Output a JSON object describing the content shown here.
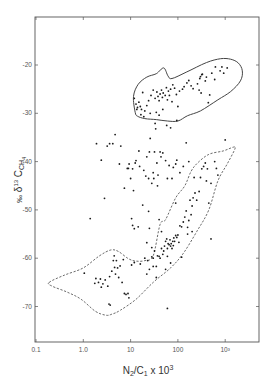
{
  "chart_data": {
    "type": "scatter",
    "title": "",
    "xlabel": "N2/C1 x 10^3",
    "ylabel": "‰ δ13C CH4",
    "xscale": "log",
    "xlim": [
      0.1,
      5000
    ],
    "ylim": [
      -77,
      -10
    ],
    "x_ticks": [
      {
        "value": 0.1,
        "label": "0.1"
      },
      {
        "value": 1,
        "label": "1.0"
      },
      {
        "value": 10,
        "label": "10"
      },
      {
        "value": 100,
        "label": "100"
      },
      {
        "value": 1000,
        "label": "10³"
      }
    ],
    "y_ticks": [
      {
        "value": -20,
        "label": "-20"
      },
      {
        "value": -30,
        "label": "-30"
      },
      {
        "value": -40,
        "label": "-40"
      },
      {
        "value": -50,
        "label": "-50"
      },
      {
        "value": -60,
        "label": "-60"
      },
      {
        "value": -70,
        "label": "-70"
      }
    ],
    "grid": false,
    "legend": null,
    "envelopes": [
      {
        "name": "upper group (solid)",
        "style": "solid",
        "points": [
          [
            12.5,
            -29.8
          ],
          [
            11.5,
            -26.5
          ],
          [
            14.5,
            -24
          ],
          [
            22,
            -22.5
          ],
          [
            35,
            -21.8
          ],
          [
            50,
            -20.6
          ],
          [
            62,
            -22.3
          ],
          [
            75,
            -22.8
          ],
          [
            150,
            -21.5
          ],
          [
            400,
            -19.5
          ],
          [
            800,
            -18.7
          ],
          [
            1300,
            -18.8
          ],
          [
            1900,
            -19.6
          ],
          [
            2300,
            -21.2
          ],
          [
            2100,
            -23.3
          ],
          [
            1300,
            -25.5
          ],
          [
            700,
            -27.2
          ],
          [
            300,
            -29.5
          ],
          [
            160,
            -30.5
          ],
          [
            100,
            -31.6
          ],
          [
            60,
            -31.6
          ],
          [
            35,
            -31.3
          ],
          [
            20,
            -31.1
          ],
          [
            14,
            -30.6
          ]
        ]
      },
      {
        "name": "lower group (dashed)",
        "style": "dashed",
        "points": [
          [
            0.19,
            -65
          ],
          [
            0.4,
            -63.5
          ],
          [
            1.0,
            -62
          ],
          [
            2.2,
            -59.5
          ],
          [
            3.8,
            -58.3
          ],
          [
            5.5,
            -58.6
          ],
          [
            9,
            -60.1
          ],
          [
            13,
            -60.6
          ],
          [
            20,
            -60.5
          ],
          [
            30,
            -59.5
          ],
          [
            42,
            -53
          ],
          [
            55,
            -52
          ],
          [
            90,
            -47.5
          ],
          [
            140,
            -45
          ],
          [
            190,
            -42
          ],
          [
            260,
            -40.3
          ],
          [
            450,
            -38.5
          ],
          [
            900,
            -37.8
          ],
          [
            1500,
            -37
          ],
          [
            1600,
            -37.4
          ],
          [
            1100,
            -40.5
          ],
          [
            700,
            -44
          ],
          [
            450,
            -50
          ],
          [
            250,
            -54.5
          ],
          [
            130,
            -59
          ],
          [
            70,
            -62
          ],
          [
            30,
            -65
          ],
          [
            13,
            -68.5
          ],
          [
            6,
            -70.8
          ],
          [
            4,
            -71.6
          ],
          [
            3,
            -71.8
          ],
          [
            1.8,
            -71
          ],
          [
            0.9,
            -68.5
          ],
          [
            0.45,
            -67
          ],
          [
            0.22,
            -65.8
          ]
        ]
      }
    ],
    "series": [
      {
        "name": "upper cluster",
        "points": [
          [
            12,
            -26.9
          ],
          [
            13,
            -28.1
          ],
          [
            14,
            -28.8
          ],
          [
            15,
            -27.7
          ],
          [
            16,
            -28.6
          ],
          [
            17,
            -29.2
          ],
          [
            13.5,
            -29.2
          ],
          [
            16.5,
            -30.3
          ],
          [
            19,
            -30.7
          ],
          [
            20,
            -29.5
          ],
          [
            22,
            -28.4
          ],
          [
            24,
            -27.4
          ],
          [
            27,
            -26.3
          ],
          [
            30,
            -25.2
          ],
          [
            33,
            -26.9
          ],
          [
            36,
            -25.6
          ],
          [
            38,
            -26.5
          ],
          [
            40,
            -27.4
          ],
          [
            42,
            -26
          ],
          [
            45,
            -25.2
          ],
          [
            47,
            -26.7
          ],
          [
            49,
            -25.8
          ],
          [
            54,
            -26.3
          ],
          [
            57,
            -24.7
          ],
          [
            60,
            -27.2
          ],
          [
            63,
            -25.4
          ],
          [
            66,
            -26.3
          ],
          [
            70,
            -25
          ],
          [
            78,
            -24.1
          ],
          [
            85,
            -24.8
          ],
          [
            93,
            -26.1
          ],
          [
            108,
            -25.4
          ],
          [
            125,
            -25
          ],
          [
            135,
            -24.5
          ],
          [
            155,
            -23.7
          ],
          [
            170,
            -23.2
          ],
          [
            190,
            -24.3
          ],
          [
            210,
            -24.9
          ],
          [
            260,
            -23.9
          ],
          [
            280,
            -25.2
          ],
          [
            290,
            -22.8
          ],
          [
            300,
            -22.4
          ],
          [
            310,
            -25.8
          ],
          [
            320,
            -22
          ],
          [
            330,
            -21.9
          ],
          [
            380,
            -23.3
          ],
          [
            400,
            -22.5
          ],
          [
            440,
            -27.8
          ],
          [
            470,
            -26.2
          ],
          [
            520,
            -21.7
          ],
          [
            600,
            -23
          ],
          [
            620,
            -20.4
          ],
          [
            780,
            -21.2
          ],
          [
            850,
            -20.4
          ],
          [
            930,
            -21.7
          ],
          [
            1100,
            -20.6
          ],
          [
            48,
            -29.2
          ],
          [
            58,
            -32.5
          ],
          [
            75,
            -27.6
          ],
          [
            95,
            -31.5
          ],
          [
            100,
            -28.6
          ],
          [
            35,
            -29.8
          ],
          [
            40,
            -30.4
          ],
          [
            26,
            -30
          ],
          [
            18,
            -25.7
          ]
        ]
      },
      {
        "name": "scattered middle",
        "points": [
          [
            1.9,
            -36.3
          ],
          [
            2.4,
            -39.7
          ],
          [
            2.8,
            -47.6
          ],
          [
            3.2,
            -36.8
          ],
          [
            3.6,
            -36.3
          ],
          [
            4.2,
            -36.3
          ],
          [
            4.7,
            -34.4
          ],
          [
            5.8,
            -40.5
          ],
          [
            6.2,
            -36.8
          ],
          [
            7.4,
            -45.5
          ],
          [
            8.5,
            -41.4
          ],
          [
            9,
            -41.4
          ],
          [
            9.3,
            -40.5
          ],
          [
            10,
            -43.5
          ],
          [
            11,
            -41.5
          ],
          [
            11.5,
            -46
          ],
          [
            12.5,
            -40.3
          ],
          [
            13,
            -39.8
          ],
          [
            14.5,
            -53.5
          ],
          [
            15,
            -37.8
          ],
          [
            15.5,
            -41
          ],
          [
            18,
            -49
          ],
          [
            19,
            -41.8
          ],
          [
            21,
            -43
          ],
          [
            22,
            -39
          ],
          [
            24,
            -43.5
          ],
          [
            25,
            -38
          ],
          [
            26,
            -35.2
          ],
          [
            28,
            -44.5
          ],
          [
            30,
            -42.3
          ],
          [
            31,
            -43.5
          ],
          [
            32,
            -38
          ],
          [
            33,
            -32.1
          ],
          [
            34,
            -33.2
          ],
          [
            36,
            -40.3
          ],
          [
            37,
            -45
          ],
          [
            38,
            -42.8
          ],
          [
            42,
            -38
          ],
          [
            44,
            -39
          ],
          [
            48,
            -38.2
          ],
          [
            55,
            -39.8
          ],
          [
            60,
            -43.5
          ],
          [
            65,
            -40.8
          ],
          [
            70,
            -33
          ],
          [
            75,
            -43.5
          ],
          [
            80,
            -41.2
          ],
          [
            90,
            -40.5
          ],
          [
            95,
            -39.7
          ],
          [
            110,
            -42.3
          ],
          [
            130,
            -41
          ],
          [
            150,
            -36.1
          ],
          [
            170,
            -40
          ],
          [
            220,
            -43.3
          ],
          [
            1.4,
            -51.8
          ],
          [
            10.5,
            -51.8
          ],
          [
            11,
            -53.2
          ],
          [
            12,
            -53.9
          ],
          [
            24,
            -50.3
          ]
        ]
      },
      {
        "name": "lower cluster",
        "points": [
          [
            1.05,
            -63.1
          ],
          [
            1.75,
            -65.2
          ],
          [
            1.85,
            -64.2
          ],
          [
            2.1,
            -65
          ],
          [
            2.3,
            -64.3
          ],
          [
            2.4,
            -66
          ],
          [
            2.6,
            -65.3
          ],
          [
            2.9,
            -64.5
          ],
          [
            3.3,
            -65.8
          ],
          [
            3.6,
            -63.8
          ],
          [
            4,
            -62.7
          ],
          [
            4.3,
            -60.5
          ],
          [
            4.6,
            -61.9
          ],
          [
            4.8,
            -63.3
          ],
          [
            5,
            -60.5
          ],
          [
            5.3,
            -62
          ],
          [
            5.6,
            -64
          ],
          [
            6,
            -61.6
          ],
          [
            6.6,
            -65
          ],
          [
            7,
            -60.3
          ],
          [
            7.4,
            -67.3
          ],
          [
            8,
            -67.5
          ],
          [
            8.8,
            -67.3
          ],
          [
            9.2,
            -68.2
          ],
          [
            10.5,
            -61.4
          ],
          [
            4.5,
            -59.5
          ],
          [
            3.5,
            -69.5
          ],
          [
            3.7,
            -69.7
          ],
          [
            12,
            -60.9
          ],
          [
            16,
            -61.2
          ],
          [
            20,
            -60
          ],
          [
            22,
            -63.3
          ],
          [
            23,
            -60.5
          ],
          [
            25,
            -62.3
          ],
          [
            28,
            -59.7
          ],
          [
            30,
            -60
          ],
          [
            32,
            -58.5
          ],
          [
            35,
            -61.7
          ],
          [
            37,
            -59.5
          ],
          [
            40,
            -59.6
          ],
          [
            42,
            -60
          ],
          [
            45,
            -58
          ],
          [
            48,
            -59.2
          ],
          [
            50,
            -58.5
          ],
          [
            52,
            -57.5
          ],
          [
            55,
            -56.5
          ],
          [
            58,
            -56
          ],
          [
            60,
            -58
          ],
          [
            62,
            -57
          ],
          [
            65,
            -57.2
          ],
          [
            68,
            -56.2
          ],
          [
            70,
            -57.5
          ],
          [
            72,
            -57
          ],
          [
            75,
            -58
          ],
          [
            78,
            -56.5
          ],
          [
            80,
            -57.4
          ],
          [
            82,
            -55.8
          ],
          [
            85,
            -56.5
          ],
          [
            90,
            -55.3
          ],
          [
            95,
            -55.7
          ],
          [
            100,
            -55.2
          ],
          [
            105,
            -56.7
          ],
          [
            110,
            -53.3
          ],
          [
            120,
            -53.5
          ],
          [
            130,
            -52.5
          ],
          [
            140,
            -51.5
          ],
          [
            150,
            -50.2
          ],
          [
            160,
            -53.6
          ],
          [
            170,
            -52.2
          ],
          [
            180,
            -48
          ],
          [
            190,
            -51
          ],
          [
            200,
            -49.2
          ],
          [
            210,
            -47.5
          ],
          [
            230,
            -46.5
          ],
          [
            250,
            -48
          ],
          [
            280,
            -46.2
          ],
          [
            300,
            -43.3
          ],
          [
            320,
            -41.5
          ],
          [
            350,
            -41
          ],
          [
            380,
            -40.3
          ],
          [
            400,
            -44
          ],
          [
            420,
            -41.5
          ],
          [
            450,
            -48.6
          ],
          [
            500,
            -44.5
          ],
          [
            600,
            -40
          ],
          [
            650,
            -41.4
          ],
          [
            700,
            -42.8
          ],
          [
            55,
            -62.3
          ],
          [
            60,
            -59.6
          ],
          [
            120,
            -59.8
          ],
          [
            160,
            -55
          ],
          [
            200,
            -54.5
          ],
          [
            90,
            -48.6
          ],
          [
            70,
            -61
          ],
          [
            500,
            -56
          ],
          [
            1000,
            -35.5
          ],
          [
            60,
            -70.4
          ],
          [
            45,
            -54.5
          ],
          [
            40,
            -52
          ],
          [
            25,
            -53.8
          ],
          [
            22,
            -56.8
          ],
          [
            28,
            -57.8
          ],
          [
            30,
            -61.7
          ],
          [
            35,
            -64
          ]
        ]
      }
    ],
    "colors": {
      "points": "#1a1a1a",
      "envelope": "#444444",
      "axis": "#555555"
    }
  }
}
